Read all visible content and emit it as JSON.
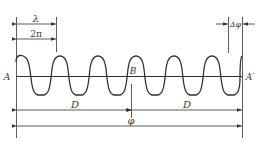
{
  "diagram": {
    "type": "wave-phase-diagram",
    "labels": {
      "wavelength": "λ",
      "two_pi": "2π",
      "delta_phi": "Δφ",
      "point_a": "A",
      "point_b": "B",
      "point_a_prime": "A′",
      "d_left": "D",
      "d_right": "D",
      "phi": "φ"
    },
    "colors": {
      "line": "#333333",
      "background": "#ffffff"
    },
    "wave": {
      "periods": 5.6,
      "description": "periodic wave oscillating about axis A–A′"
    }
  }
}
